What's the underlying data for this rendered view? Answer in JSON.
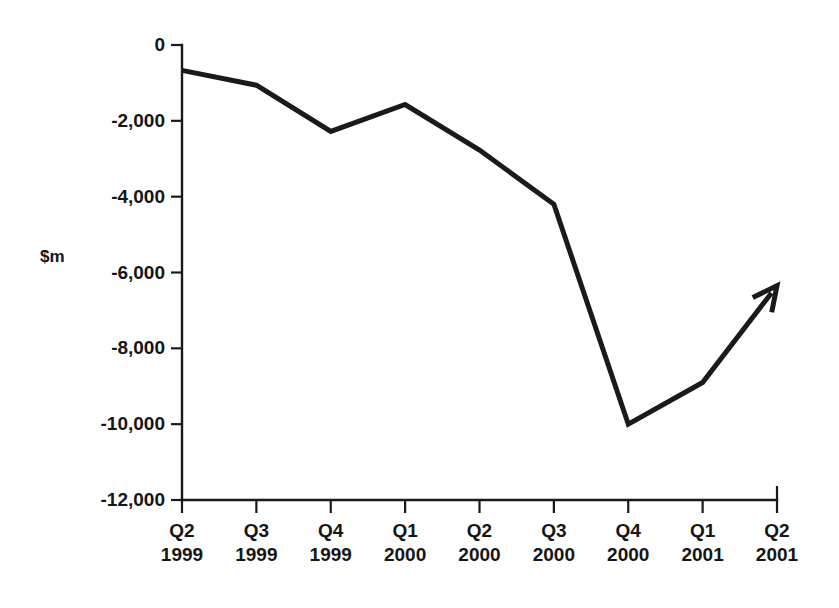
{
  "chart_data": {
    "type": "line",
    "title": "",
    "subtitle": "",
    "xlabel": "",
    "ylabel": "$m",
    "ylim": [
      -12000,
      0
    ],
    "ytick_values": [
      0,
      -2000,
      -4000,
      -6000,
      -8000,
      -10000,
      -12000
    ],
    "ytick_labels": [
      "0",
      "-2,000",
      "-4,000",
      "-6,000",
      "-8,000",
      "-10,000",
      "-12,000"
    ],
    "grid": true,
    "grid_axis": "y",
    "legend": false,
    "legend_position": "none",
    "categories": [
      "Q2 1999",
      "Q3 1999",
      "Q4 1999",
      "Q1 2000",
      "Q2 2000",
      "Q3 2000",
      "Q4 2000",
      "Q1 2001",
      "Q2 2001"
    ],
    "xtick_quarters": [
      "Q2",
      "Q3",
      "Q4",
      "Q1",
      "Q2",
      "Q3",
      "Q4",
      "Q1",
      "Q2"
    ],
    "xtick_years": [
      "1999",
      "1999",
      "1999",
      "2000",
      "2000",
      "2000",
      "2000",
      "2001",
      "2001"
    ],
    "values": [
      -670,
      -1060,
      -2280,
      -1570,
      -2770,
      -4200,
      -10000,
      -8900,
      -6350
    ],
    "annotations": [
      {
        "name": "trend-arrowhead",
        "at_category": "Q2 2001",
        "value": -6350,
        "note": "line terminates in an upward-pointing arrowhead"
      }
    ],
    "series_name": "",
    "line_color": "#1a1a1a",
    "line_width_px": 5,
    "background_color": "#ffffff",
    "axis_color": "#1a1a1a",
    "grid_color": "#6f6f6f"
  },
  "axis": {
    "unit_label": "$m"
  }
}
